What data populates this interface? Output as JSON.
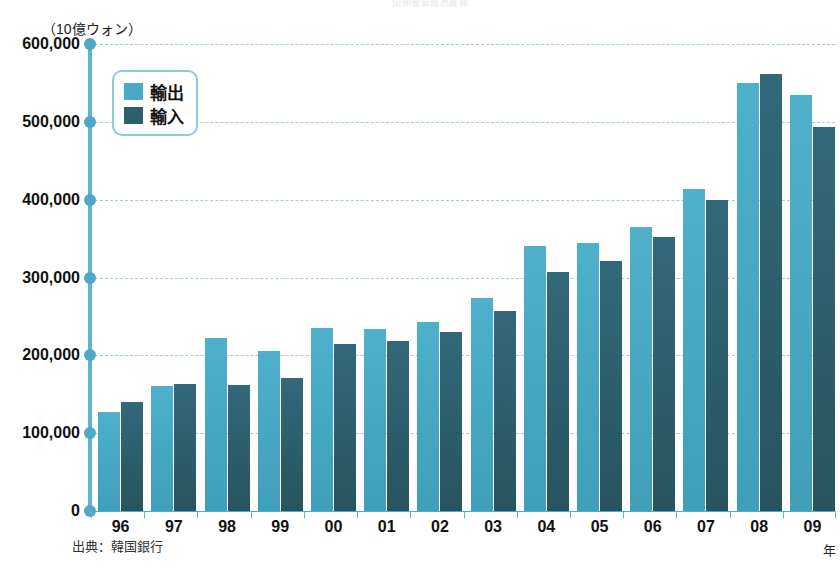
{
  "top_caption": "国別貿易額の推移",
  "axis": {
    "unit_label": "（10億ウォン）",
    "x_axis_title": "年",
    "y_ticks": [
      "600,000",
      "500,000",
      "400,000",
      "300,000",
      "200,000",
      "100,000",
      "0"
    ]
  },
  "legend": {
    "items": [
      {
        "label": "輸出",
        "color": "#4aa9c5"
      },
      {
        "label": "輸入",
        "color": "#2d5f6d"
      }
    ]
  },
  "source": "出典：韓国銀行",
  "colors": {
    "export": "#4aa9c5",
    "import": "#2d5f6d",
    "axis": "#5fb4cd",
    "gridline": "#8fc5d6",
    "legend_border": "#8ecadb",
    "background": "#ffffff",
    "text": "#111111"
  },
  "chart_data": {
    "type": "bar",
    "title": "国別貿易額の推移",
    "xlabel": "年",
    "ylabel": "（10億ウォン）",
    "ylim": [
      0,
      600000
    ],
    "ytick_step": 100000,
    "grid": true,
    "legend_position": "top-left",
    "categories": [
      "96",
      "97",
      "98",
      "99",
      "00",
      "01",
      "02",
      "03",
      "04",
      "05",
      "06",
      "07",
      "08",
      "09"
    ],
    "series": [
      {
        "name": "輸出",
        "color": "#4aa9c5",
        "values": [
          127000,
          160000,
          222000,
          206000,
          235000,
          234000,
          243000,
          274000,
          341000,
          344000,
          365000,
          414000,
          550000,
          534000
        ]
      },
      {
        "name": "輸入",
        "color": "#2d5f6d",
        "values": [
          140000,
          163000,
          162000,
          171000,
          215000,
          219000,
          230000,
          257000,
          307000,
          321000,
          352000,
          400000,
          562000,
          493000
        ]
      }
    ]
  }
}
